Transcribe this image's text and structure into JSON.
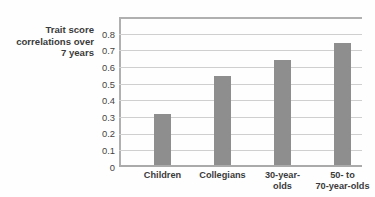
{
  "chart_data": {
    "type": "bar",
    "title": "",
    "subtitle": "",
    "xlabel": "",
    "ylabel": "Trait score\ncorrelations over\n7 years",
    "categories": [
      "Children",
      "Collegians",
      "30-year-\nolds",
      "50- to\n70-year-olds"
    ],
    "values": [
      0.31,
      0.54,
      0.64,
      0.74
    ],
    "ylim": [
      0,
      0.9
    ],
    "ytick_labels": [
      "0.8",
      "0.7",
      "0.6",
      "0.5",
      "0.4",
      "0.3",
      "0.2",
      "0.1",
      "0"
    ],
    "ytick_values": [
      0.8,
      0.7,
      0.6,
      0.5,
      0.4,
      0.3,
      0.2,
      0.1,
      0
    ],
    "grid": true,
    "legend": "none",
    "bar_color": "#8e8e8e",
    "gridline_color": "#cfcfcf",
    "axis_color": "#b0b0b0",
    "background_color": "#fefefe",
    "text_color": "#3b3b3b"
  }
}
